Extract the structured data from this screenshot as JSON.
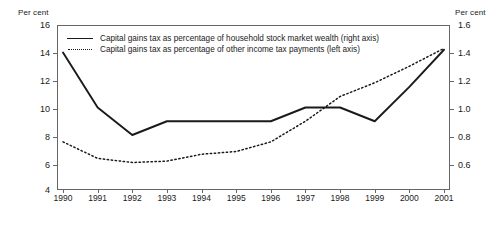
{
  "chart_data": {
    "type": "line",
    "title": "",
    "xlabel": "",
    "categories": [
      "1990",
      "1991",
      "1992",
      "1993",
      "1994",
      "1995",
      "1996",
      "1997",
      "1998",
      "1999",
      "2000",
      "2001"
    ],
    "grid": false,
    "legend_position": "top-left",
    "left_axis": {
      "label": "Per cent",
      "ticks": [
        "16",
        "14",
        "12",
        "10",
        "8",
        "6",
        "4"
      ],
      "ylim": [
        4,
        16
      ]
    },
    "right_axis": {
      "label": "Per cent",
      "ticks": [
        "1.6",
        "1.4",
        "1.2",
        "1.0",
        "0.8",
        "0.6"
      ],
      "ylim": [
        0.4,
        1.6
      ]
    },
    "series": [
      {
        "name": "Capital gains tax as percentage of household stock market wealth (right axis)",
        "style": "solid",
        "axis": "right",
        "values": [
          1.4,
          1.0,
          0.8,
          0.9,
          0.9,
          0.9,
          0.9,
          1.0,
          1.0,
          0.9,
          1.15,
          1.42
        ]
      },
      {
        "name": "Capital gains tax as percentage of other income tax payments (left axis)",
        "style": "dotted",
        "axis": "left",
        "values": [
          7.5,
          6.3,
          6.0,
          6.1,
          6.6,
          6.8,
          7.5,
          9.0,
          10.8,
          11.8,
          13.0,
          14.3
        ]
      }
    ]
  }
}
